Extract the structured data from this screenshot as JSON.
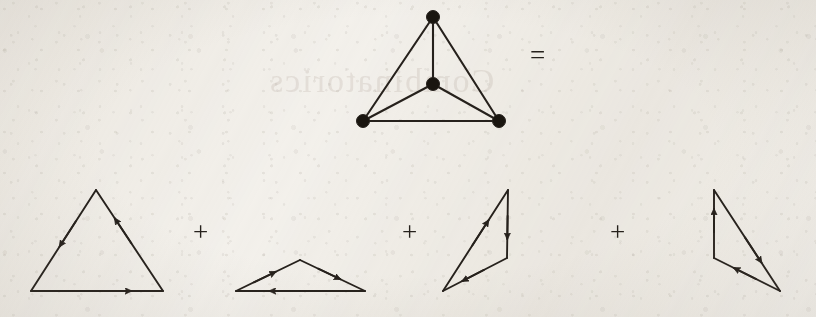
{
  "figure": {
    "background_color": "#f4f2ee",
    "ink_color": "#26211c",
    "width": 816,
    "height": 317
  },
  "operators": {
    "equals": "=",
    "plus": "+"
  },
  "equation": {
    "left_side_label": "diamond-graph",
    "operator": "=",
    "terms": [
      "directed-triangle-1",
      "directed-triangle-2",
      "directed-triangle-3",
      "directed-triangle-4"
    ],
    "term_separator": "+"
  },
  "chart_data": {
    "type": "diagram",
    "notation": "graph-equals-sum-of-directed-cycles",
    "left_graph": {
      "name": "diamond-graph",
      "vertex_count": 4,
      "edge_count": 5,
      "vertices": [
        {
          "id": "top",
          "x": 433,
          "y": 17,
          "r": 6.5
        },
        {
          "id": "center",
          "x": 433,
          "y": 84,
          "r": 6.5
        },
        {
          "id": "bottom-left",
          "x": 363,
          "y": 121,
          "r": 6.5
        },
        {
          "id": "bottom-right",
          "x": 499,
          "y": 121,
          "r": 6.5
        }
      ],
      "edges": [
        {
          "from": "top",
          "to": "bottom-left"
        },
        {
          "from": "top",
          "to": "bottom-right"
        },
        {
          "from": "top",
          "to": "center"
        },
        {
          "from": "center",
          "to": "bottom-left"
        },
        {
          "from": "center",
          "to": "bottom-right"
        },
        {
          "from": "bottom-left",
          "to": "bottom-right"
        }
      ]
    },
    "right_terms": [
      {
        "name": "directed-triangle-1",
        "orientation": "counterclockwise",
        "vertices": [
          {
            "id": "apex",
            "x": 96,
            "y": 190
          },
          {
            "id": "bottom-left",
            "x": 31,
            "y": 291
          },
          {
            "id": "bottom-right",
            "x": 163,
            "y": 291
          }
        ],
        "arcs": [
          {
            "from": "apex",
            "to": "bottom-left",
            "arrow_at": 0.56,
            "direction": "down-left"
          },
          {
            "from": "bottom-left",
            "to": "bottom-right",
            "arrow_at": 0.76,
            "direction": "right"
          },
          {
            "from": "bottom-right",
            "to": "apex",
            "arrow_at": 0.72,
            "direction": "up-left"
          }
        ]
      },
      {
        "name": "directed-triangle-2",
        "orientation": "clockwise",
        "vertices": [
          {
            "id": "apex",
            "x": 300,
            "y": 260
          },
          {
            "id": "left",
            "x": 236,
            "y": 291
          },
          {
            "id": "right",
            "x": 365,
            "y": 291
          }
        ],
        "arcs": [
          {
            "from": "left",
            "to": "apex",
            "arrow_at": 0.62,
            "direction": "up-right"
          },
          {
            "from": "apex",
            "to": "right",
            "arrow_at": 0.62,
            "direction": "down-right"
          },
          {
            "from": "right",
            "to": "left",
            "arrow_at": 0.74,
            "direction": "left"
          }
        ]
      },
      {
        "name": "directed-triangle-3",
        "orientation": "clockwise",
        "vertices": [
          {
            "id": "top",
            "x": 508,
            "y": 190
          },
          {
            "id": "right-mid",
            "x": 507,
            "y": 258
          },
          {
            "id": "bottom-left",
            "x": 443,
            "y": 291
          }
        ],
        "arcs": [
          {
            "from": "bottom-left",
            "to": "top",
            "arrow_at": 0.7,
            "direction": "up-right"
          },
          {
            "from": "top",
            "to": "right-mid",
            "arrow_at": 0.72,
            "direction": "down"
          },
          {
            "from": "right-mid",
            "to": "bottom-left",
            "arrow_at": 0.7,
            "direction": "down-left"
          }
        ]
      },
      {
        "name": "directed-triangle-4",
        "orientation": "counterclockwise",
        "vertices": [
          {
            "id": "top",
            "x": 714,
            "y": 190
          },
          {
            "id": "left-mid",
            "x": 714,
            "y": 258
          },
          {
            "id": "bottom-right",
            "x": 780,
            "y": 291
          }
        ],
        "arcs": [
          {
            "from": "left-mid",
            "to": "top",
            "arrow_at": 0.72,
            "direction": "up"
          },
          {
            "from": "top",
            "to": "bottom-right",
            "arrow_at": 0.72,
            "direction": "down-right"
          },
          {
            "from": "bottom-right",
            "to": "left-mid",
            "arrow_at": 0.7,
            "direction": "up-left"
          }
        ]
      }
    ],
    "operator_positions": [
      {
        "symbol": "=",
        "x": 539,
        "y": 57
      },
      {
        "symbol": "+",
        "x": 201,
        "y": 234
      },
      {
        "symbol": "+",
        "x": 410,
        "y": 234
      },
      {
        "symbol": "+",
        "x": 618,
        "y": 234
      }
    ]
  }
}
